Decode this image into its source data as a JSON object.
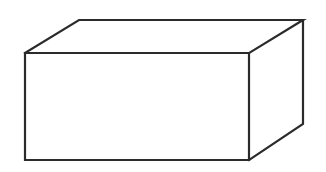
{
  "diagram": {
    "type": "rectangular-prism",
    "background": "#ffffff",
    "stroke_color": "#2b2b2b",
    "stroke_width": 2.2,
    "fill_color": "#ffffff",
    "vertices": {
      "front_top_left": [
        25,
        53
      ],
      "front_top_right": [
        249,
        53
      ],
      "front_bottom_right": [
        249,
        160
      ],
      "front_bottom_left": [
        25,
        160
      ],
      "back_top_left": [
        79,
        20
      ],
      "back_top_right": [
        303,
        20
      ],
      "back_bottom_right": [
        303,
        124
      ]
    }
  }
}
